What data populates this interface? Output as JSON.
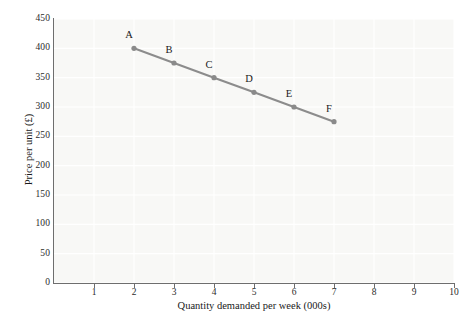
{
  "chart_data": {
    "type": "line",
    "title": "",
    "subtitle": "",
    "xlabel": "Quantity demanded per week (000s)",
    "ylabel": "Price per unit (£)",
    "xlim": [
      0,
      10
    ],
    "ylim": [
      0,
      450
    ],
    "x_ticks": [
      1,
      2,
      3,
      4,
      5,
      6,
      7,
      8,
      9,
      10
    ],
    "x_tick_labels": [
      "1",
      "2",
      "3",
      "4",
      "5",
      "6",
      "7",
      "8",
      "9",
      "10"
    ],
    "y_ticks": [
      0,
      50,
      100,
      150,
      200,
      250,
      300,
      350,
      400,
      450
    ],
    "y_tick_labels": [
      "0",
      "50",
      "100",
      "150",
      "200",
      "250",
      "300",
      "350",
      "400",
      "450"
    ],
    "grid": true,
    "legend": "none",
    "series": [
      {
        "name": "Demand",
        "color": "#8c8c8c",
        "marker": "circle",
        "x": [
          2,
          3,
          4,
          5,
          6,
          7
        ],
        "values": [
          400,
          375,
          350,
          325,
          300,
          275
        ],
        "point_labels": [
          "A",
          "B",
          "C",
          "D",
          "E",
          "F"
        ]
      }
    ],
    "annotations": [
      {
        "text": "A",
        "x": 2,
        "y": 400
      },
      {
        "text": "B",
        "x": 3,
        "y": 375
      },
      {
        "text": "C",
        "x": 4,
        "y": 350
      },
      {
        "text": "D",
        "x": 5,
        "y": 325
      },
      {
        "text": "E",
        "x": 6,
        "y": 300
      },
      {
        "text": "F",
        "x": 7,
        "y": 275
      }
    ],
    "colors": {
      "line": "#8c8c8c",
      "marker": "#8a8a8a",
      "axis": "#6e6e6e",
      "plot_background": "#f8f8f6",
      "gridline": "#ffffff",
      "page_background": "#ffffff",
      "text": "#1a1a1a"
    }
  }
}
